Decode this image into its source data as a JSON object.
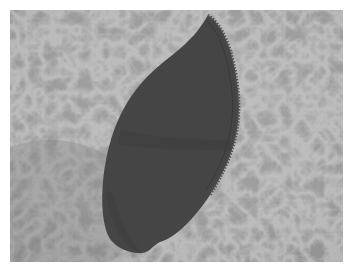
{
  "image": {
    "description": "Dark charcoal leaf-shaped fabric appliqué with zigzag-stitched edge on a grey floral-patterned fabric background",
    "subject": "fabric-leaf",
    "colors": {
      "border": "#ffffff",
      "background": "#a3a3a3",
      "background_dark": "#8c8c8c",
      "pattern_light": "#c8c8c8",
      "leaf": "#2b2b2b",
      "leaf_shadow": "#1f1f1f",
      "stitch": "#3d3d3d"
    }
  }
}
